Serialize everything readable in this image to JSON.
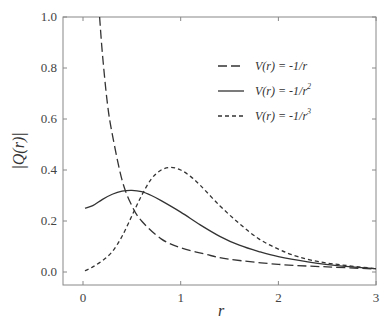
{
  "chart_data": {
    "type": "line",
    "title": "",
    "xlabel": "r",
    "ylabel": "|Q(r)|",
    "xlim": [
      -0.2,
      3.0
    ],
    "ylim": [
      -0.05,
      1.0
    ],
    "xticks": [
      0,
      1,
      2,
      3
    ],
    "xtick_labels": [
      "0",
      "1",
      "2",
      "3"
    ],
    "yticks": [
      0.0,
      0.2,
      0.4,
      0.6,
      0.8,
      1.0
    ],
    "ytick_labels": [
      "0.0",
      "0.2",
      "0.4",
      "0.6",
      "0.8",
      "1.0"
    ],
    "grid": false,
    "legend_position": "upper right",
    "series": [
      {
        "name": "V(r) = -1/r",
        "label_main": "V(r) = -1/r",
        "label_sup": "",
        "style": "long-dash",
        "x": [
          0.17,
          0.2,
          0.25,
          0.3,
          0.4,
          0.5,
          0.6,
          0.8,
          1.0,
          1.25,
          1.5,
          2.0,
          2.5,
          3.0
        ],
        "y": [
          1.0,
          0.85,
          0.66,
          0.54,
          0.36,
          0.26,
          0.2,
          0.13,
          0.095,
          0.07,
          0.05,
          0.03,
          0.02,
          0.012
        ]
      },
      {
        "name": "V(r) = -1/r^2",
        "label_main": "V(r) = -1/r",
        "label_sup": "2",
        "style": "solid",
        "x": [
          0.02,
          0.1,
          0.2,
          0.3,
          0.4,
          0.5,
          0.6,
          0.7,
          0.8,
          1.0,
          1.2,
          1.4,
          1.6,
          1.8,
          2.0,
          2.3,
          2.6,
          3.0
        ],
        "y": [
          0.25,
          0.26,
          0.285,
          0.305,
          0.317,
          0.32,
          0.315,
          0.3,
          0.28,
          0.235,
          0.185,
          0.14,
          0.105,
          0.08,
          0.06,
          0.04,
          0.025,
          0.013
        ]
      },
      {
        "name": "V(r) = -1/r^3",
        "label_main": "V(r) = -1/r",
        "label_sup": "3",
        "style": "short-dash",
        "x": [
          0.02,
          0.1,
          0.2,
          0.3,
          0.4,
          0.5,
          0.6,
          0.7,
          0.8,
          0.9,
          1.0,
          1.1,
          1.2,
          1.4,
          1.6,
          1.8,
          2.0,
          2.2,
          2.5,
          3.0
        ],
        "y": [
          0.005,
          0.02,
          0.045,
          0.08,
          0.14,
          0.22,
          0.3,
          0.365,
          0.4,
          0.41,
          0.4,
          0.375,
          0.34,
          0.26,
          0.19,
          0.13,
          0.09,
          0.06,
          0.035,
          0.013
        ]
      }
    ]
  },
  "axes": {
    "xlabel": "r",
    "ylabel": "|Q(r)|"
  },
  "legend": [
    {
      "label": "V(r) = -1/r",
      "sup": ""
    },
    {
      "label": "V(r) = -1/r",
      "sup": "2"
    },
    {
      "label": "V(r) = -1/r",
      "sup": "3"
    }
  ],
  "colors": {
    "axis": "#888888",
    "line": "#333333"
  }
}
